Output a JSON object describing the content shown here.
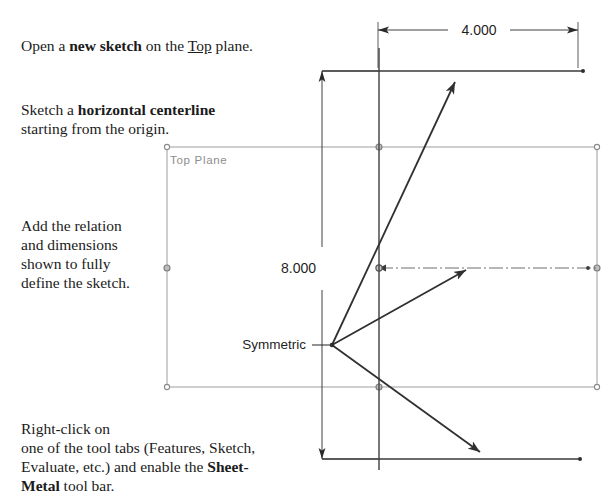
{
  "instructions": {
    "open_sketch": {
      "pre": "Open a ",
      "bold": "new sketch",
      "mid": " on the ",
      "underline": "Top",
      "post": " plane."
    },
    "centerline": {
      "pre": "Sketch a ",
      "bold": "horizontal centerline",
      "post": "\nstarting from the origin."
    },
    "relation": "Add the relation\nand dimensions\nshown to fully\ndefine the sketch.",
    "rightclick": {
      "pre": "Right-click on\none of the tool tabs (Features, Sketch,\nEvaluate, etc.) and enable the ",
      "bold": "Sheet-\nMetal",
      "post": " tool bar."
    }
  },
  "drawing": {
    "plane_label": "Top Plane",
    "symmetric_label": "Symmetric",
    "dimensions": {
      "horizontal": "4.000",
      "vertical": "8.000"
    },
    "colors": {
      "sketch_line": "#3a3a3a",
      "plane_outline": "#9a9a9a",
      "plane_label": "#8d8d8d",
      "dimension": "#2a2a2a",
      "centerline": "#6e6e6e",
      "background": "#ffffff"
    },
    "geometry": {
      "origin": {
        "x": 379,
        "y": 268
      },
      "vertex": {
        "x": 332,
        "y": 345
      },
      "top_line": {
        "x1": 322,
        "y1": 71,
        "x2": 583,
        "y2": 71
      },
      "bottom_line": {
        "x1": 322,
        "y1": 459,
        "x2": 580,
        "y2": 459
      },
      "vertical_line": {
        "x": 379,
        "y1": 48,
        "y2": 470
      },
      "centerline": {
        "x1": 379,
        "y1": 268,
        "x2": 597,
        "y2": 268
      },
      "plane_rect": {
        "x": 167,
        "y": 147,
        "w": 430,
        "h": 240
      },
      "arrows": [
        {
          "name": "upper-arrow",
          "x1": 332,
          "y1": 345,
          "x2": 461,
          "y2": 69
        },
        {
          "name": "middle-arrow",
          "x1": 332,
          "y1": 345,
          "x2": 474,
          "y2": 266
        },
        {
          "name": "lower-arrow",
          "x1": 332,
          "y1": 345,
          "x2": 489,
          "y2": 459
        }
      ],
      "dim_horizontal": {
        "y": 30,
        "x1": 378,
        "x2": 578
      },
      "dim_vertical": {
        "x": 322,
        "y1": 71,
        "y2": 459
      }
    }
  }
}
